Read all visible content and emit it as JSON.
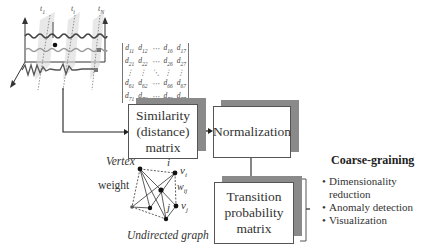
{
  "time_series": {
    "time_labels": [
      "t1",
      "ti",
      "tN"
    ],
    "time_label_display": [
      "t₁",
      "tᵢ",
      "t_N"
    ]
  },
  "matrix": {
    "rows": [
      [
        "d11",
        "d12",
        "⋯",
        "d16",
        "d17"
      ],
      [
        "d21",
        "d22",
        "⋯",
        "d26",
        "d27"
      ],
      [
        "⋮",
        "⋮",
        "⋱",
        "⋮",
        "⋮"
      ],
      [
        "d61",
        "d62",
        "⋯",
        "d66",
        "d67"
      ],
      [
        "d71",
        "d72",
        "⋯",
        "d76",
        "d77"
      ]
    ]
  },
  "boxes": {
    "similarity": {
      "line1": "Similarity",
      "line2": "(distance)",
      "line3": "matrix"
    },
    "normalization": {
      "label": "Normalization"
    },
    "transition": {
      "line1": "Transition",
      "line2": "probability",
      "line3": "matrix"
    }
  },
  "graph": {
    "vertex_label": "Vertex",
    "weight_label": "weight",
    "node_i": "i",
    "node_j": "j",
    "vi": "v",
    "vi_sub": "i",
    "vj": "v",
    "vj_sub": "j",
    "wij": "w",
    "wij_sub": "ij",
    "caption": "Undirected graph"
  },
  "coarse_graining": {
    "title": "Coarse-graining",
    "items": [
      "Dimensionality",
      "reduction",
      "Anomaly detection",
      "Visualization"
    ]
  },
  "colors": {
    "shadow": "#8a8a8a",
    "border": "#555555",
    "line": "#222222"
  }
}
